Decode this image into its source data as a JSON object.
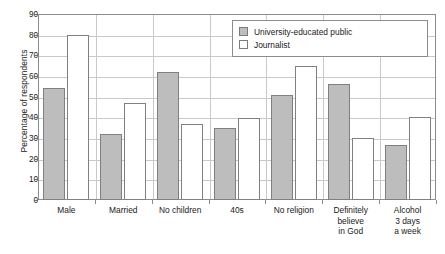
{
  "chart_data": {
    "type": "bar",
    "title": "",
    "subtitle": "",
    "xlabel": "",
    "ylabel": "Percentage of respondents",
    "ylim": [
      0,
      90
    ],
    "ytick_step": 10,
    "yticks": [
      0,
      10,
      20,
      30,
      40,
      50,
      60,
      70,
      80,
      90
    ],
    "ytick_labels": [
      "0",
      "10",
      "20",
      "30",
      "40",
      "50",
      "60",
      "70",
      "80",
      "90"
    ],
    "grid": "horizontal",
    "legend_position": "top-right",
    "categories": [
      "Male",
      "Married",
      "No children",
      "40s",
      "No religion",
      "Definitely believe in God",
      "Alcohol 3 days a week"
    ],
    "category_label_lines": [
      [
        "Male"
      ],
      [
        "Married"
      ],
      [
        "No children"
      ],
      [
        "40s"
      ],
      [
        "No religion"
      ],
      [
        "Definitely",
        "believe",
        "in God"
      ],
      [
        "Alcohol",
        "3 days",
        "a week"
      ]
    ],
    "series": [
      {
        "name": "University-educated public",
        "color": "#bdbdbd",
        "values": [
          54,
          32,
          62,
          35,
          51,
          56,
          26.5
        ]
      },
      {
        "name": "Journalist",
        "color": "#ffffff",
        "values": [
          80,
          47,
          37,
          39.5,
          65,
          30,
          40
        ]
      }
    ]
  },
  "legend": {
    "items": [
      {
        "label": "University-educated public",
        "swatch": "gray-filled-square"
      },
      {
        "label": "Journalist",
        "swatch": "white-outlined-square"
      }
    ]
  },
  "axes": {
    "y_title": "Percentage of respondents"
  },
  "colors": {
    "series_university": "#bdbdbd",
    "series_journalist": "#ffffff",
    "bar_outline": "#808080",
    "gridline": "#c9c9c9",
    "frame": "#8c8c8c",
    "text": "#1a1a1a",
    "background": "#ffffff"
  }
}
